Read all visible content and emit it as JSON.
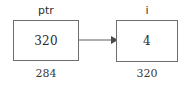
{
  "diagram": {
    "type": "pointer-memory-diagram",
    "background_color": "#ffffff",
    "border_color": "#6e6e6e",
    "text_color": "#2b2b2b",
    "nodes": [
      {
        "id": "ptr",
        "variable_label": "ptr",
        "value": "320",
        "address": "284"
      },
      {
        "id": "i",
        "variable_label": "i",
        "value": "4",
        "address": "320"
      }
    ],
    "edges": [
      {
        "id": "ptr-to-i",
        "from": "ptr",
        "to": "i",
        "style": "solid-arrow",
        "direction": "right"
      }
    ]
  }
}
